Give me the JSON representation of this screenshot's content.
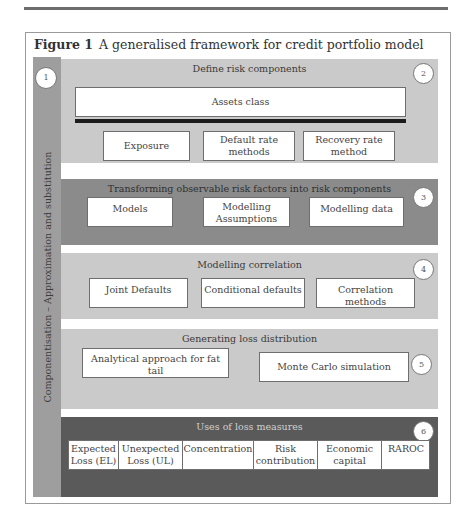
{
  "page": {
    "running_head": "Credit Risk Portfolio Models"
  },
  "figure": {
    "label": "Figure 1",
    "title": "A generalised framework for credit portfolio model",
    "side_label": "Componentisation – Approximation and substitution",
    "side_number": "1",
    "colors": {
      "side_strip": "#9e9e9e",
      "light_section": "#cacaca",
      "medium_section": "#8b8b8b",
      "dark_section": "#5a5a5a",
      "box": "#ffffff",
      "thick_bar": "#1c1c1c"
    },
    "sections": [
      {
        "number": "2",
        "title": "Define risk components",
        "header_box": "Assets class",
        "boxes": [
          "Exposure",
          "Default rate methods",
          "Recovery rate method"
        ]
      },
      {
        "number": "3",
        "title": "Transforming observable risk factors into risk components",
        "boxes": [
          "Models",
          "Modelling Assumptions",
          "Modelling data"
        ]
      },
      {
        "number": "4",
        "title": "Modelling correlation",
        "boxes": [
          "Joint Defaults",
          "Conditional defaults",
          "Correlation methods"
        ]
      },
      {
        "number": "5",
        "title": "Generating loss distribution",
        "boxes": [
          "Analytical approach for fat tail",
          "Monte Carlo simulation"
        ]
      },
      {
        "number": "6",
        "title": "Uses of loss measures",
        "cells": [
          "Expected Loss (EL)",
          "Unexpected Loss (UL)",
          "Concentration",
          "Risk contribution",
          "Economic capital",
          "RAROC"
        ]
      }
    ]
  }
}
